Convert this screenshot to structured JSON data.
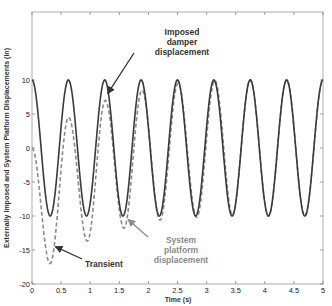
{
  "chart_data": {
    "type": "line",
    "title": "",
    "xlabel": "Time (s)",
    "ylabel": "Externally Imposed and System Platform Displacements (in)",
    "xlim": [
      0,
      5
    ],
    "ylim": [
      -20,
      20
    ],
    "xticks": [
      0,
      0.5,
      1,
      1.5,
      2,
      2.5,
      3,
      3.5,
      4,
      4.5,
      5
    ],
    "xtick_labels": [
      "0",
      "0.5",
      "1",
      "1.5",
      "2",
      "2.5",
      "3",
      "3.5",
      "4",
      "4.5",
      "5"
    ],
    "yticks": [
      -20,
      -15,
      -10,
      -5,
      0,
      5,
      10
    ],
    "ytick_labels": [
      "-20",
      "-15",
      "-10",
      "-5",
      "0",
      "5",
      "10"
    ],
    "grid": false,
    "legend": null,
    "series": [
      {
        "name": "Imposed damper displacement",
        "style": "solid",
        "color": "#3a3a3a",
        "description": "cosine, amplitude 10 in, frequency 1.6 Hz",
        "amplitude": 10,
        "frequency_hz": 1.6,
        "peaks_t": [
          0,
          0.625,
          1.25,
          1.875,
          2.5,
          3.125,
          3.75,
          4.375,
          5.0
        ],
        "peak_values": [
          10,
          10,
          10,
          10,
          10,
          10,
          10,
          10,
          10
        ],
        "trough_values": [
          -10,
          -10,
          -10,
          -10,
          -10,
          -10,
          -10,
          -10
        ]
      },
      {
        "name": "System platform displacement",
        "style": "dashed",
        "color": "#8a8a8a",
        "description": "starts at 0, transient decays, converges to imposed displacement by ~2.2 s",
        "extrema": [
          {
            "t": 0.0,
            "y": 0
          },
          {
            "t": 0.31,
            "y": -17
          },
          {
            "t": 0.63,
            "y": 4.5
          },
          {
            "t": 0.95,
            "y": -13.7
          },
          {
            "t": 1.26,
            "y": 7.0
          },
          {
            "t": 1.58,
            "y": -11.8
          },
          {
            "t": 1.89,
            "y": 8.5
          },
          {
            "t": 2.2,
            "y": -10.6
          },
          {
            "t": 2.51,
            "y": 9.5
          },
          {
            "t": 2.83,
            "y": -10.2
          },
          {
            "t": 3.14,
            "y": 9.9
          },
          {
            "t": 3.45,
            "y": -10
          },
          {
            "t": 5.0,
            "y": 10
          }
        ]
      }
    ],
    "annotations": [
      {
        "text": [
          "Imposed",
          "damper",
          "displacement"
        ],
        "color": "#333333",
        "arrow_to": {
          "t": 1.3,
          "y": 8
        }
      },
      {
        "text": [
          "Transient"
        ],
        "color": "#333333",
        "arrow_to": {
          "t": 0.4,
          "y": -14.5
        }
      },
      {
        "text": [
          "System",
          "platform",
          "displacement"
        ],
        "color": "#8a8a8a",
        "arrow_to": {
          "t": 1.65,
          "y": -10.5
        }
      }
    ]
  }
}
